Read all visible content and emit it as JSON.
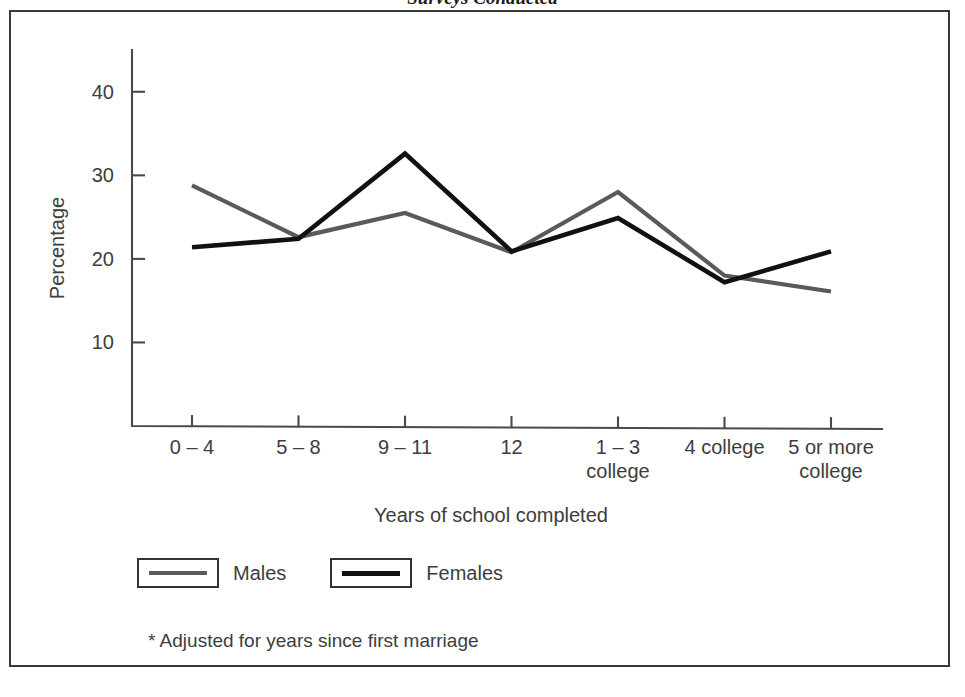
{
  "page": {
    "running_head": "Surveys Conducted"
  },
  "figure": {
    "footnote": "* Adjusted for years since first marriage"
  },
  "legend": {
    "position": "below-plot",
    "entries": [
      {
        "label": "Males",
        "color": "#5a5a5a"
      },
      {
        "label": "Females",
        "color": "#111111"
      }
    ]
  },
  "colors": {
    "males": "#5a5a5a",
    "females": "#111111",
    "axis": "#4a4a4a",
    "frame": "#3a3a3a",
    "text": "#3d3d3d"
  },
  "chart_data": {
    "type": "line",
    "title": "",
    "xlabel": "Years of school completed",
    "ylabel": "Percentage",
    "categories": [
      "0 – 4",
      "5 – 8",
      "9 – 11",
      "12",
      "1 – 3\ncollege",
      "4 college",
      "5 or more\ncollege"
    ],
    "category_lines": [
      [
        "0 – 4"
      ],
      [
        "5 – 8"
      ],
      [
        "9 – 11"
      ],
      [
        "12"
      ],
      [
        "1 – 3",
        "college"
      ],
      [
        "4 college"
      ],
      [
        "5 or more",
        "college"
      ]
    ],
    "series": [
      {
        "name": "Males",
        "color": "#5a5a5a",
        "values": [
          28.8,
          22.6,
          25.5,
          20.8,
          28.0,
          18.0,
          16.1
        ]
      },
      {
        "name": "Females",
        "color": "#111111",
        "values": [
          21.4,
          22.4,
          32.6,
          20.9,
          24.9,
          17.2,
          20.9
        ]
      }
    ],
    "ylim": [
      0,
      45
    ],
    "yticks": [
      10,
      20,
      30,
      40
    ],
    "ytick_labels": [
      "10",
      "20",
      "30",
      "40"
    ],
    "grid": false,
    "legend_position": "bottom-left"
  }
}
